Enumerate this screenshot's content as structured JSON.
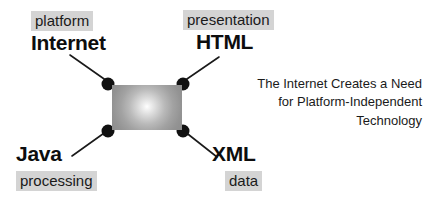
{
  "diagram": {
    "center": {
      "name": "gradient-core",
      "fill_center_color": "#ffffff",
      "fill_edge_color": "#8d8d8d"
    },
    "caption": "The Internet Creates a Need\nfor Platform-Independent\nTechnology",
    "tag_background_color": "#d4d4d4",
    "text_color": "#0d0d0d",
    "nodes": [
      {
        "id": "internet",
        "title": "Internet",
        "tag": "platform"
      },
      {
        "id": "html",
        "title": "HTML",
        "tag": "presentation"
      },
      {
        "id": "java",
        "title": "Java",
        "tag": "processing"
      },
      {
        "id": "xml",
        "title": "XML",
        "tag": "data"
      }
    ],
    "connectors": [
      {
        "id": "internet",
        "x1": 70,
        "y1": 55,
        "x2": 107,
        "y2": 81
      },
      {
        "id": "html",
        "x1": 219,
        "y1": 57,
        "x2": 184,
        "y2": 81
      },
      {
        "id": "java",
        "x1": 72,
        "y1": 156,
        "x2": 107,
        "y2": 131
      },
      {
        "id": "xml",
        "x1": 217,
        "y1": 157,
        "x2": 184,
        "y2": 131
      }
    ],
    "dots": [
      {
        "id": "dot-top-left",
        "cx": 108,
        "cy": 84,
        "r": 6.5
      },
      {
        "id": "dot-top-right",
        "cx": 183,
        "cy": 84,
        "r": 6.5
      },
      {
        "id": "dot-bottom-left",
        "cx": 108,
        "cy": 131,
        "r": 6.5
      },
      {
        "id": "dot-bottom-right",
        "cx": 183,
        "cy": 131,
        "r": 6.5
      }
    ]
  }
}
